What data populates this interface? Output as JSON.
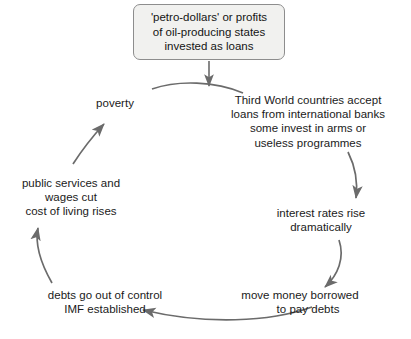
{
  "diagram": {
    "type": "cycle-flowchart",
    "background_color": "#ffffff",
    "arrow_color": "#6b6b6b",
    "text_color": "#1a1a1a",
    "box_fill_color": "#f1f1ef",
    "box_border_color": "#8d8d8d",
    "source": {
      "text": "'petro-dollars' or profits\nof oil-producing states\ninvested as loans"
    },
    "nodes": [
      {
        "id": "third-world",
        "text": "Third World countries accept\nloans from international banks\nsome invest in arms or\nuseless programmes"
      },
      {
        "id": "interest",
        "text": "interest rates rise\ndramatically"
      },
      {
        "id": "move-money",
        "line1": "move money borrowed",
        "line2": "to pay debts"
      },
      {
        "id": "debts",
        "text": "debts go out of control\nIMF established"
      },
      {
        "id": "public",
        "text": "public services and\nwages cut\ncost of living rises"
      },
      {
        "id": "poverty",
        "text": "poverty"
      }
    ]
  }
}
